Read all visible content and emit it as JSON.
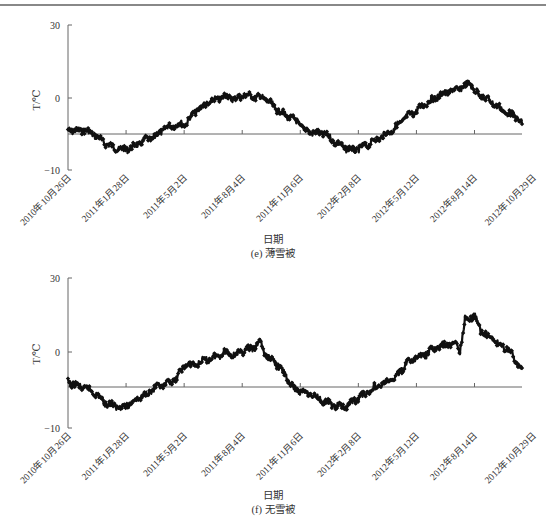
{
  "chart_data": [
    {
      "type": "line",
      "title": "(e) 薄雪被",
      "caption_label": "(e) 薄雪被",
      "xlabel": "日期",
      "ylabel": "T/℃",
      "y_ticks": [
        {
          "label": "30",
          "pixel_y": 25
        },
        {
          "label": "0",
          "pixel_y": 98
        },
        {
          "label": "−10",
          "pixel_y": 170
        }
      ],
      "x_ticks": [
        "2010年10月26日",
        "2011年1月28日",
        "2011年5月2日",
        "2011年8月4日",
        "2011年11月6日",
        "2012年2月8日",
        "2012年5月12日",
        "2012年8月14日",
        "2012年10月29日"
      ],
      "reference_line_pixel_y": 134,
      "plot_box": {
        "x0": 68,
        "x1": 522,
        "y_top": 25,
        "y_bottom": 170
      },
      "series": [
        {
          "name": "T",
          "marker": "diamond",
          "color": "#111111",
          "x_px": [
            68,
            75,
            85,
            95,
            105,
            115,
            125,
            135,
            145,
            155,
            165,
            175,
            185,
            195,
            205,
            215,
            225,
            235,
            245,
            255,
            265,
            275,
            285,
            295,
            305,
            315,
            325,
            335,
            345,
            355,
            365,
            375,
            385,
            395,
            405,
            415,
            425,
            435,
            445,
            455,
            465,
            470,
            475,
            485,
            495,
            505,
            515,
            522
          ],
          "y_px": [
            130,
            131,
            130,
            135,
            143,
            148,
            150,
            146,
            140,
            137,
            128,
            125,
            124,
            112,
            105,
            100,
            96,
            99,
            95,
            97,
            98,
            108,
            115,
            120,
            130,
            133,
            134,
            142,
            148,
            150,
            146,
            140,
            135,
            128,
            118,
            112,
            104,
            98,
            93,
            90,
            86,
            82,
            92,
            98,
            104,
            112,
            116,
            124
          ],
          "approx_values_degC": [
            -4.4,
            -4.6,
            -4.4,
            -5.1,
            -6.3,
            -6.9,
            -7.2,
            -6.7,
            -5.8,
            -5.4,
            -4.2,
            -3.8,
            -3.6,
            -2.0,
            -1.0,
            -0.3,
            0.3,
            -0.1,
            0.4,
            0.1,
            0.0,
            -1.4,
            -2.4,
            -3.1,
            -4.4,
            -4.9,
            -5.0,
            -6.1,
            -6.9,
            -7.2,
            -6.7,
            -5.8,
            -5.1,
            -4.2,
            -2.8,
            -2.0,
            -0.8,
            0.0,
            0.7,
            1.1,
            1.7,
            2.2,
            0.8,
            0.0,
            -0.8,
            -2.0,
            -2.5,
            -3.6
          ]
        }
      ]
    },
    {
      "type": "line",
      "title": "(f) 无雪被",
      "caption_label": "(f) 无雪被",
      "xlabel": "日期",
      "ylabel": "T/℃",
      "y_ticks": [
        {
          "label": "30",
          "pixel_y": 278
        },
        {
          "label": "0",
          "pixel_y": 352
        },
        {
          "label": "−10",
          "pixel_y": 428
        }
      ],
      "x_ticks": [
        "2010年10月26日",
        "2011年1月28日",
        "2011年5月2日",
        "2011年8月4日",
        "2011年11月6日",
        "2012年2月8日",
        "2012年5月12日",
        "2012年8月14日",
        "2012年10月29日"
      ],
      "reference_line_pixel_y": 387,
      "plot_box": {
        "x0": 68,
        "x1": 522,
        "y_top": 278,
        "y_bottom": 428
      },
      "series": [
        {
          "name": "T",
          "marker": "diamond",
          "color": "#111111",
          "x_px": [
            68,
            75,
            85,
            95,
            105,
            115,
            125,
            135,
            145,
            155,
            165,
            175,
            185,
            195,
            205,
            215,
            225,
            235,
            245,
            255,
            260,
            265,
            275,
            285,
            295,
            305,
            315,
            325,
            335,
            345,
            355,
            365,
            375,
            385,
            395,
            405,
            415,
            425,
            435,
            445,
            455,
            460,
            465,
            470,
            475,
            480,
            490,
            500,
            510,
            518,
            522
          ],
          "y_px": [
            382,
            385,
            388,
            393,
            403,
            406,
            407,
            400,
            395,
            388,
            385,
            380,
            365,
            365,
            360,
            357,
            352,
            355,
            350,
            348,
            340,
            355,
            362,
            375,
            390,
            392,
            396,
            402,
            406,
            407,
            400,
            394,
            387,
            383,
            378,
            365,
            358,
            355,
            348,
            345,
            343,
            350,
            320,
            318,
            315,
            330,
            338,
            345,
            350,
            365,
            368
          ],
          "approx_values_degC": [
            -4.0,
            -4.4,
            -4.8,
            -5.4,
            -6.7,
            -7.1,
            -7.2,
            -6.3,
            -5.7,
            -4.8,
            -4.4,
            -3.7,
            -1.7,
            -1.7,
            -1.1,
            -0.7,
            0.0,
            -0.4,
            0.3,
            0.5,
            1.6,
            -0.4,
            -1.3,
            -3.0,
            -5.0,
            -5.3,
            -5.8,
            -6.6,
            -7.1,
            -7.2,
            -6.3,
            -5.5,
            -4.6,
            -4.1,
            -3.4,
            -1.7,
            -0.8,
            -0.4,
            0.5,
            0.9,
            1.2,
            0.3,
            4.2,
            4.5,
            4.9,
            2.9,
            1.8,
            0.9,
            0.3,
            -1.7,
            -2.1
          ]
        }
      ]
    }
  ]
}
